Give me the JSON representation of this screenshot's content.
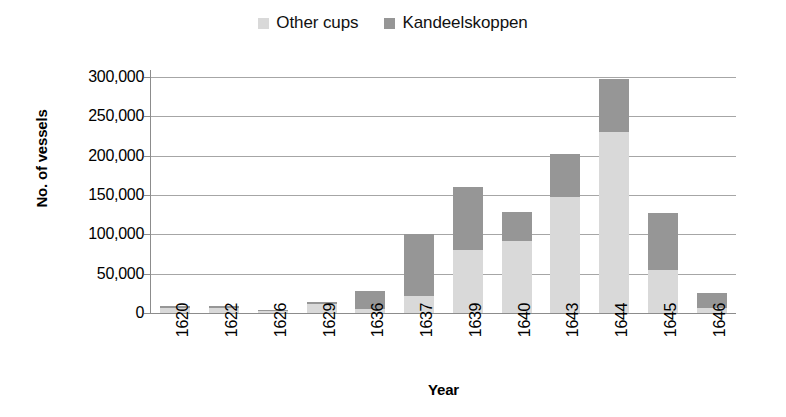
{
  "chart_data": {
    "type": "bar",
    "stacked": true,
    "title": "",
    "xlabel": "Year",
    "ylabel": "No. of vessels",
    "categories": [
      "1620",
      "1622",
      "1626",
      "1629",
      "1636",
      "1637",
      "1639",
      "1640",
      "1643",
      "1644",
      "1645",
      "1646"
    ],
    "series": [
      {
        "name": "Other cups",
        "color": "#d9d9d9",
        "values": [
          7000,
          7000,
          2500,
          12000,
          5000,
          22000,
          80000,
          92000,
          147000,
          230000,
          55000,
          6000
        ]
      },
      {
        "name": "Kandeelskoppen",
        "color": "#969696",
        "values": [
          1500,
          1500,
          1000,
          1500,
          23000,
          78000,
          80000,
          37000,
          55000,
          68000,
          72000,
          19000
        ]
      }
    ],
    "totals": [
      8500,
      8500,
      3500,
      13500,
      28000,
      100000,
      160000,
      129000,
      202000,
      298000,
      127000,
      25000
    ],
    "ylim": [
      0,
      300000
    ],
    "y_ticks": [
      "0",
      "50,000",
      "100,000",
      "150,000",
      "200,000",
      "250,000",
      "300,000"
    ],
    "y_tick_values": [
      0,
      50000,
      100000,
      150000,
      200000,
      250000,
      300000
    ],
    "grid": true,
    "legend_position": "top-center"
  },
  "legend": {
    "entries": [
      {
        "label": "Other cups",
        "color": "#d9d9d9"
      },
      {
        "label": "Kandeelskoppen",
        "color": "#969696"
      }
    ]
  },
  "axes": {
    "y_title": "No. of vessels",
    "x_title": "Year"
  }
}
